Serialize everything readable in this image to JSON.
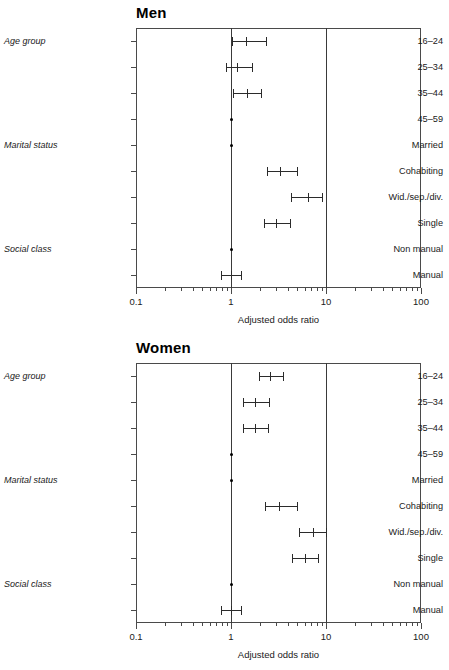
{
  "figure": {
    "axis_title": "Adjusted odds ratio",
    "x_tick_labels": [
      "0.1",
      "1",
      "10",
      "100"
    ],
    "group_labels": {
      "age": "Age group",
      "marital": "Marital status",
      "social": "Social class"
    },
    "row_labels": [
      "16–24",
      "25–34",
      "35–44",
      "45–59",
      "Married",
      "Cohabiting",
      "Wid./sep./div.",
      "Single",
      "Non manual",
      "Manual"
    ]
  },
  "chart_data": [
    {
      "type": "scatter",
      "title": "Men",
      "xlabel": "Adjusted odds ratio",
      "ylabel": "",
      "xscale": "log",
      "xlim": [
        0.1,
        100
      ],
      "xticks": [
        0.1,
        1,
        10,
        100
      ],
      "xtick_labels": [
        "0.1",
        "1",
        "10",
        "100"
      ],
      "grid": false,
      "legend": "none",
      "reference_line": 1,
      "categories": [
        "16–24",
        "25–34",
        "35–44",
        "45–59",
        "Married",
        "Cohabiting",
        "Wid./sep./div.",
        "Single",
        "Non manual",
        "Manual"
      ],
      "points": [
        {
          "label": "16–24",
          "group": "Age group",
          "odds_ratio": 1.44,
          "ci_low": 1.02,
          "ci_high": 2.35,
          "reference": false
        },
        {
          "label": "25–34",
          "group": "Age group",
          "odds_ratio": 1.16,
          "ci_low": 0.88,
          "ci_high": 1.65,
          "reference": false
        },
        {
          "label": "35–44",
          "group": "Age group",
          "odds_ratio": 1.47,
          "ci_low": 1.05,
          "ci_high": 2.05,
          "reference": false
        },
        {
          "label": "45–59",
          "group": "Age group",
          "odds_ratio": 1.0,
          "ci_low": 1.0,
          "ci_high": 1.0,
          "reference": true
        },
        {
          "label": "Married",
          "group": "Marital status",
          "odds_ratio": 1.0,
          "ci_low": 1.0,
          "ci_high": 1.0,
          "reference": true
        },
        {
          "label": "Cohabiting",
          "group": "Marital status",
          "odds_ratio": 3.3,
          "ci_low": 2.4,
          "ci_high": 5.0,
          "reference": false
        },
        {
          "label": "Wid./sep./div.",
          "group": "Marital status",
          "odds_ratio": 6.5,
          "ci_low": 4.3,
          "ci_high": 9.0,
          "reference": false
        },
        {
          "label": "Single",
          "group": "Marital status",
          "odds_ratio": 3.0,
          "ci_low": 2.2,
          "ci_high": 4.2,
          "reference": false
        },
        {
          "label": "Non manual",
          "group": "Social class",
          "odds_ratio": 1.0,
          "ci_low": 1.0,
          "ci_high": 1.0,
          "reference": true
        },
        {
          "label": "Manual",
          "group": "Social class",
          "odds_ratio": 1.0,
          "ci_low": 0.79,
          "ci_high": 1.28,
          "reference": false
        }
      ]
    },
    {
      "type": "scatter",
      "title": "Women",
      "xlabel": "Adjusted odds ratio",
      "ylabel": "",
      "xscale": "log",
      "xlim": [
        0.1,
        100
      ],
      "xticks": [
        0.1,
        1,
        10,
        100
      ],
      "xtick_labels": [
        "0.1",
        "1",
        "10",
        "100"
      ],
      "grid": false,
      "legend": "none",
      "reference_line": 1,
      "categories": [
        "16–24",
        "25–34",
        "35–44",
        "45–59",
        "Married",
        "Cohabiting",
        "Wid./sep./div.",
        "Single",
        "Non manual",
        "Manual"
      ],
      "points": [
        {
          "label": "16–24",
          "group": "Age group",
          "odds_ratio": 2.6,
          "ci_low": 1.95,
          "ci_high": 3.5,
          "reference": false
        },
        {
          "label": "25–34",
          "group": "Age group",
          "odds_ratio": 1.8,
          "ci_low": 1.35,
          "ci_high": 2.5,
          "reference": false
        },
        {
          "label": "35–44",
          "group": "Age group",
          "odds_ratio": 1.8,
          "ci_low": 1.35,
          "ci_high": 2.45,
          "reference": false
        },
        {
          "label": "45–59",
          "group": "Age group",
          "odds_ratio": 1.0,
          "ci_low": 1.0,
          "ci_high": 1.0,
          "reference": true
        },
        {
          "label": "Married",
          "group": "Marital status",
          "odds_ratio": 1.0,
          "ci_low": 1.0,
          "ci_high": 1.0,
          "reference": true
        },
        {
          "label": "Cohabiting",
          "group": "Marital status",
          "odds_ratio": 3.2,
          "ci_low": 2.3,
          "ci_high": 4.9,
          "reference": false
        },
        {
          "label": "Wid./sep./div.",
          "group": "Marital status",
          "odds_ratio": 7.3,
          "ci_low": 5.2,
          "ci_high": 10.0,
          "reference": false
        },
        {
          "label": "Single",
          "group": "Marital status",
          "odds_ratio": 6.0,
          "ci_low": 4.4,
          "ci_high": 8.3,
          "reference": false
        },
        {
          "label": "Non manual",
          "group": "Social class",
          "odds_ratio": 1.0,
          "ci_low": 1.0,
          "ci_high": 1.0,
          "reference": true
        },
        {
          "label": "Manual",
          "group": "Social class",
          "odds_ratio": 1.0,
          "ci_low": 0.78,
          "ci_high": 1.26,
          "reference": false
        }
      ]
    }
  ]
}
